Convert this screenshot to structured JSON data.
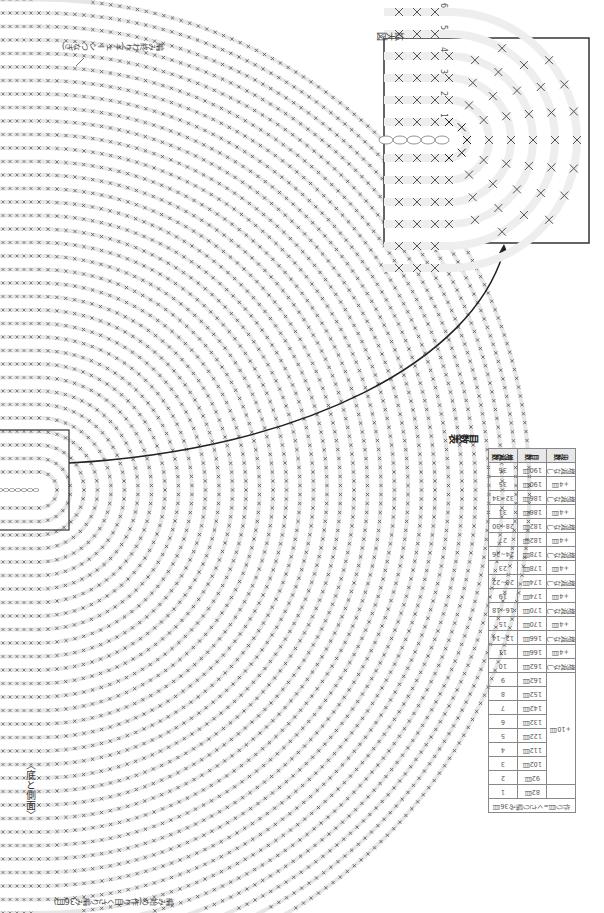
{
  "figure": {
    "title": "〈底と側面〉",
    "magnified_label": "拡大図",
    "end_note": "編み終わり(チェーンつなぎ)",
    "start_note": "編み始め(作り目くさり編み36目)",
    "inset_round_labels": [
      "1",
      "2",
      "3",
      "4",
      "5",
      "6"
    ]
  },
  "stitch_table": {
    "title": "目数表",
    "headers": [
      "段数",
      "目数",
      "増減数"
    ],
    "rows": [
      {
        "round": "36",
        "count": "190目",
        "change": "増減なし"
      },
      {
        "round": "35",
        "count": "190目",
        "change": "+4目"
      },
      {
        "round": "32~34",
        "count": "186目",
        "change": "増減なし"
      },
      {
        "round": "31",
        "count": "186目",
        "change": "+4目"
      },
      {
        "round": "28~30",
        "count": "182目",
        "change": "増減なし"
      },
      {
        "round": "27",
        "count": "182目",
        "change": "+4目"
      },
      {
        "round": "24~26",
        "count": "178目",
        "change": "増減なし"
      },
      {
        "round": "23",
        "count": "178目",
        "change": "+4目"
      },
      {
        "round": "20~22",
        "count": "174目",
        "change": "増減なし"
      },
      {
        "round": "19",
        "count": "174目",
        "change": "+4目"
      },
      {
        "round": "16~18",
        "count": "170目",
        "change": "増減なし"
      },
      {
        "round": "15",
        "count": "170目",
        "change": "+4目"
      },
      {
        "round": "12~14",
        "count": "166目",
        "change": "増減なし"
      },
      {
        "round": "11",
        "count": "166目",
        "change": "+4目"
      },
      {
        "round": "10",
        "count": "162目",
        "change": "増減なし"
      },
      {
        "round": "9",
        "count": "162目",
        "change": "+10目"
      },
      {
        "round": "8",
        "count": "152目",
        "change": "+10目"
      },
      {
        "round": "7",
        "count": "142目",
        "change": "+10目"
      },
      {
        "round": "6",
        "count": "132目",
        "change": "+10目"
      },
      {
        "round": "5",
        "count": "122目",
        "change": "+10目"
      },
      {
        "round": "4",
        "count": "112目",
        "change": "+10目"
      },
      {
        "round": "3",
        "count": "102目",
        "change": "+10目"
      },
      {
        "round": "2",
        "count": "92目",
        "change": "+10目"
      },
      {
        "round": "1",
        "count": "82目",
        "change": ""
      }
    ],
    "footer": "作り目=くさり編み36目",
    "merged_change_label": "+10目"
  },
  "colors": {
    "stitch": "#555555",
    "guide_ring": "#e6e6e6",
    "frame": "#333333",
    "arrow": "#222222"
  }
}
